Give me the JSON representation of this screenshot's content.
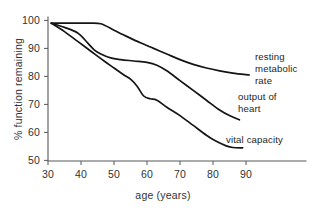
{
  "chart_data": {
    "type": "line",
    "title": "",
    "subtitle": "",
    "xlabel": "age (years)",
    "ylabel": "% function remaining",
    "xlim": [
      30,
      95
    ],
    "ylim": [
      50,
      100
    ],
    "xticks": [
      30,
      40,
      50,
      60,
      70,
      80,
      90
    ],
    "yticks": [
      50,
      60,
      70,
      80,
      90,
      100
    ],
    "xtick_labels": [
      "30",
      "40",
      "50",
      "60",
      "70",
      "80",
      "90"
    ],
    "ytick_labels": [
      "50",
      "60",
      "70",
      "80",
      "90",
      "100"
    ],
    "grid": false,
    "legend": "inline-curve-labels",
    "series": [
      {
        "name": "resting metabolic rate",
        "label_lines": [
          "resting",
          "metabolic",
          "rate"
        ],
        "x": [
          31,
          34,
          38,
          42,
          46,
          50,
          54,
          58,
          62,
          66,
          70,
          74,
          78,
          82,
          86,
          91
        ],
        "y": [
          99,
          99,
          99,
          99,
          98.8,
          96.5,
          94.2,
          92.0,
          90.0,
          88.0,
          86.0,
          84.3,
          83.0,
          82.0,
          81.2,
          80.5
        ]
      },
      {
        "name": "output of heart",
        "label_lines": [
          "output of",
          "heart"
        ],
        "x": [
          31,
          35,
          39,
          42,
          44,
          46,
          49,
          52,
          56,
          60,
          63,
          66,
          70,
          74,
          78,
          82,
          85,
          88
        ],
        "y": [
          99,
          97.5,
          95.5,
          92.0,
          89.5,
          88.0,
          86.6,
          86.0,
          85.5,
          85.0,
          84.0,
          82.0,
          78.5,
          75.0,
          71.5,
          68.0,
          66.0,
          64.5
        ]
      },
      {
        "name": "vital capacity",
        "label_lines": [
          "vital capacity"
        ],
        "x": [
          31,
          35,
          39,
          43,
          47,
          50,
          53,
          55,
          57,
          59,
          61,
          63,
          66,
          70,
          74,
          78,
          81,
          84,
          86,
          89
        ],
        "y": [
          99,
          96.0,
          92.5,
          89.0,
          85.5,
          83.0,
          80.5,
          79.0,
          76.5,
          73.0,
          72.0,
          71.5,
          69.0,
          66.0,
          62.5,
          59.0,
          56.8,
          55.2,
          54.6,
          54.5
        ]
      }
    ]
  },
  "colors": {
    "curve": "#151515",
    "axis": "#56585a",
    "text": "#303234",
    "background": "#ffffff"
  }
}
